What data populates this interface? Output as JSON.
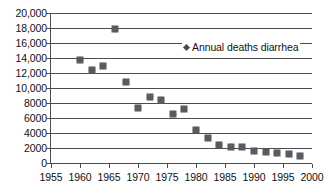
{
  "chart_data": {
    "type": "scatter",
    "title": "",
    "xlabel": "",
    "ylabel": "",
    "xlim": [
      1955,
      2000
    ],
    "ylim": [
      0,
      20000
    ],
    "grid": "horizontal",
    "legend_position": "inside-top-right",
    "marker": "diamond",
    "marker_color": "#4a4a52",
    "axis_color": "#4d4d4d",
    "background_color": "#ffffff",
    "x_ticks": [
      "1955",
      "1960",
      "1965",
      "1970",
      "1975",
      "1980",
      "1985",
      "1990",
      "1995",
      "2000"
    ],
    "x_tick_values": [
      1955,
      1960,
      1965,
      1970,
      1975,
      1980,
      1985,
      1990,
      1995,
      2000
    ],
    "y_ticks": [
      "0",
      "2000",
      "4000",
      "6000",
      "8000",
      "10,000",
      "12,000",
      "14,000",
      "16,000",
      "18,000",
      "20,000"
    ],
    "y_tick_values": [
      0,
      2000,
      4000,
      6000,
      8000,
      10000,
      12000,
      14000,
      16000,
      18000,
      20000
    ],
    "series": [
      {
        "name": "Annual deaths diarrhea",
        "x": [
          1960,
          1962,
          1964,
          1966,
          1968,
          1970,
          1972,
          1974,
          1976,
          1978,
          1980,
          1982,
          1984,
          1986,
          1988,
          1990,
          1992,
          1994,
          1996,
          1998
        ],
        "values": [
          13800,
          12400,
          13000,
          17900,
          10800,
          7300,
          8800,
          8400,
          6600,
          7200,
          4400,
          3350,
          2450,
          2150,
          2100,
          1650,
          1500,
          1350,
          1200,
          900
        ]
      }
    ],
    "legend": [
      "Annual deaths diarrhea"
    ]
  }
}
